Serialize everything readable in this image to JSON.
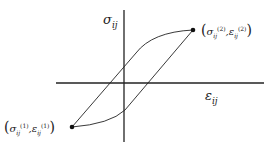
{
  "diagram": {
    "type": "hysteresis-loop",
    "y_axis_label": {
      "base": "σ",
      "sub": "ij"
    },
    "x_axis_label": {
      "base": "ε",
      "sub": "ij"
    },
    "point_top": {
      "sigma": "σ",
      "sigma_sub": "ij",
      "sigma_sup": "(2)",
      "eps": "ε",
      "eps_sub": "ij",
      "eps_sup": "(2)",
      "open": "(",
      "comma": ",",
      "close": ")"
    },
    "point_bottom": {
      "sigma": "σ",
      "sigma_sub": "ij",
      "sigma_sup": "(1)",
      "eps": "ε",
      "eps_sub": "ij",
      "eps_sup": "(1)",
      "open": "(",
      "comma": ",",
      "close": ")"
    },
    "colors": {
      "line": "#222222",
      "background": "#ffffff"
    }
  }
}
